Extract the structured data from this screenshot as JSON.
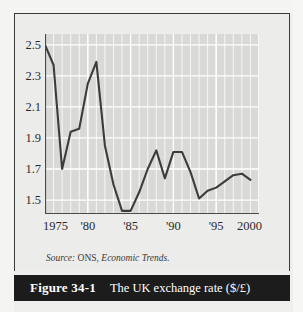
{
  "figure": {
    "number_label": "Figure 34-1",
    "title": "The UK exchange rate ($/£)",
    "source_prefix": "Source:",
    "source_body": "ONS,",
    "source_publication": "Economic Trends."
  },
  "colors": {
    "page_background": "#efefed",
    "figure_background": "#ececeb",
    "plot_background": "#d9d9d7",
    "gridline": "#f7f7f6",
    "gridline_major": "#ffffff",
    "line": "#3c3c3c",
    "axis": "#4a4a4a",
    "caption_bar": "#1c1c1c",
    "caption_text": "#ffffff",
    "frame_border": "#3a3a3a"
  },
  "chart_data": {
    "type": "line",
    "title": "The UK exchange rate ($/£)",
    "xlabel": "",
    "ylabel": "",
    "xlim": [
      1975,
      2000
    ],
    "ylim": [
      1.41,
      2.57
    ],
    "grid": true,
    "legend": null,
    "ytick_labels": [
      "2.5",
      "2.3",
      "2.1",
      "1.9",
      "1.7",
      "1.5"
    ],
    "ytick_values": [
      2.5,
      2.3,
      2.1,
      1.9,
      1.7,
      1.5
    ],
    "xtick_labels": [
      "1975",
      "'80",
      "'85",
      "'90",
      "'95",
      "2000"
    ],
    "xtick_values": [
      1975,
      1980,
      1985,
      1990,
      1995,
      2000
    ],
    "minor_xtick_step": 1,
    "series": [
      {
        "name": "UK exchange rate ($/£)",
        "x": [
          1975,
          1976,
          1977,
          1978,
          1979,
          1980,
          1981,
          1982,
          1983,
          1984,
          1985,
          1986,
          1987,
          1988,
          1989,
          1990,
          1991,
          1992,
          1993,
          1994,
          1995,
          1996,
          1997,
          1998,
          1999
        ],
        "values": [
          2.5,
          2.37,
          1.7,
          1.94,
          1.96,
          2.25,
          2.39,
          1.85,
          1.6,
          1.43,
          1.43,
          1.55,
          1.7,
          1.82,
          1.64,
          1.81,
          1.81,
          1.68,
          1.51,
          1.56,
          1.58,
          1.62,
          1.66,
          1.67,
          1.63
        ]
      }
    ]
  }
}
